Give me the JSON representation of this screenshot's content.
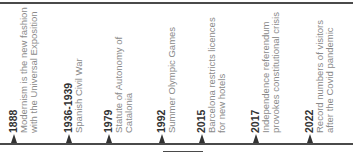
{
  "timeline": {
    "line_color": "#4a4a4a",
    "marker_color": "#333333",
    "events": [
      {
        "year": "1888",
        "line1": "Modernism is the new fashion",
        "line2": "with the Universal Exposition",
        "x": 8
      },
      {
        "year": "1936-1939",
        "line1": "Spanish Civil War",
        "line2": "",
        "x": 63
      },
      {
        "year": "1979",
        "line1": "Statute of Autonomy of",
        "line2": "Catalonia",
        "x": 103
      },
      {
        "year": "1992",
        "line1": "Summer Olympic Games",
        "line2": "",
        "x": 156
      },
      {
        "year": "2015",
        "line1": "Barcelona restricts licences",
        "line2": "for new hotels",
        "x": 196
      },
      {
        "year": "2017",
        "line1": "Independence referendum",
        "line2": "provokes constitutional crisis",
        "x": 250
      },
      {
        "year": "2022",
        "line1": "Record numbers of visitors",
        "line2": "after the Covid pandemic",
        "x": 304
      }
    ]
  }
}
